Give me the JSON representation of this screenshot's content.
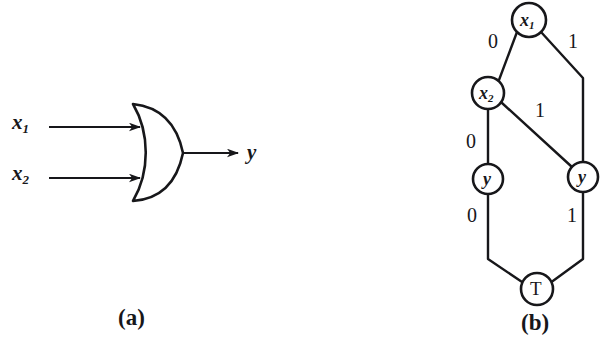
{
  "figure": {
    "stroke_color": "#17171a",
    "background_color": "#ffffff",
    "panels": [
      {
        "id": "a",
        "caption": "(a)",
        "description": "two-input OR gate"
      },
      {
        "id": "b",
        "caption": "(b)",
        "description": "binary decision diagram"
      }
    ]
  },
  "panel_a": {
    "caption": "(a)",
    "gate": {
      "type": "or-gate"
    },
    "inputs": [
      {
        "name": "x1",
        "base": "x",
        "subscript": "1"
      },
      {
        "name": "x2",
        "base": "x",
        "subscript": "2"
      }
    ],
    "output": {
      "name": "y",
      "base": "y",
      "subscript": ""
    }
  },
  "panel_b": {
    "caption": "(b)",
    "nodes": [
      {
        "id": "x1",
        "base": "x",
        "subscript": "1",
        "shape": "circle",
        "style": "italic"
      },
      {
        "id": "x2",
        "base": "x",
        "subscript": "2",
        "shape": "circle",
        "style": "italic"
      },
      {
        "id": "y_left",
        "base": "y",
        "subscript": "",
        "shape": "circle",
        "style": "italic"
      },
      {
        "id": "y_right",
        "base": "y",
        "subscript": "",
        "shape": "circle",
        "style": "italic"
      },
      {
        "id": "terminal",
        "base": "T",
        "subscript": "",
        "shape": "circle",
        "style": "upright"
      }
    ],
    "edges": [
      {
        "from": "x1",
        "to": "x2",
        "label": "0"
      },
      {
        "from": "x1",
        "to": "y_right",
        "label": "1"
      },
      {
        "from": "x2",
        "to": "y_left",
        "label": "0"
      },
      {
        "from": "x2",
        "to": "y_right",
        "label": "1"
      },
      {
        "from": "y_left",
        "to": "terminal",
        "label": "0"
      },
      {
        "from": "y_right",
        "to": "terminal",
        "label": "1"
      }
    ],
    "edge_labels": {
      "x1_low": "0",
      "x1_high": "1",
      "x2_low": "0",
      "x2_high": "1",
      "y_left_low": "0",
      "y_right_high": "1"
    }
  }
}
